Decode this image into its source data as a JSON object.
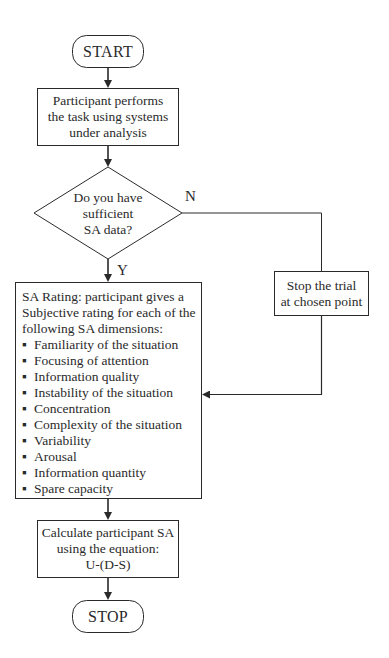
{
  "flowchart": {
    "start": {
      "label": "START"
    },
    "task": {
      "lines": [
        "Participant performs",
        "the task using systems",
        "under analysis"
      ]
    },
    "decision": {
      "lines": [
        "Do you have",
        "sufficient",
        "SA data?"
      ],
      "yes_label": "Y",
      "no_label": "N"
    },
    "stop_trial": {
      "lines": [
        "Stop the trial",
        "at chosen point"
      ]
    },
    "sa_rating": {
      "intro_lines": [
        "SA Rating: participant gives a",
        "Subjective rating for each of the",
        "following SA dimensions:"
      ],
      "bullet": "▪",
      "dimensions": [
        "Familiarity of the situation",
        "Focusing of attention",
        "Information quality",
        "Instability of the situation",
        "Concentration",
        "Complexity of the situation",
        "Variability",
        "Arousal",
        "Information quantity",
        "Spare capacity"
      ]
    },
    "calculate": {
      "lines": [
        "Calculate participant SA",
        "using the equation:",
        "U-(D-S)"
      ]
    },
    "stop": {
      "label": "STOP"
    }
  },
  "colors": {
    "line": "#2a2a2a",
    "background": "#ffffff"
  }
}
